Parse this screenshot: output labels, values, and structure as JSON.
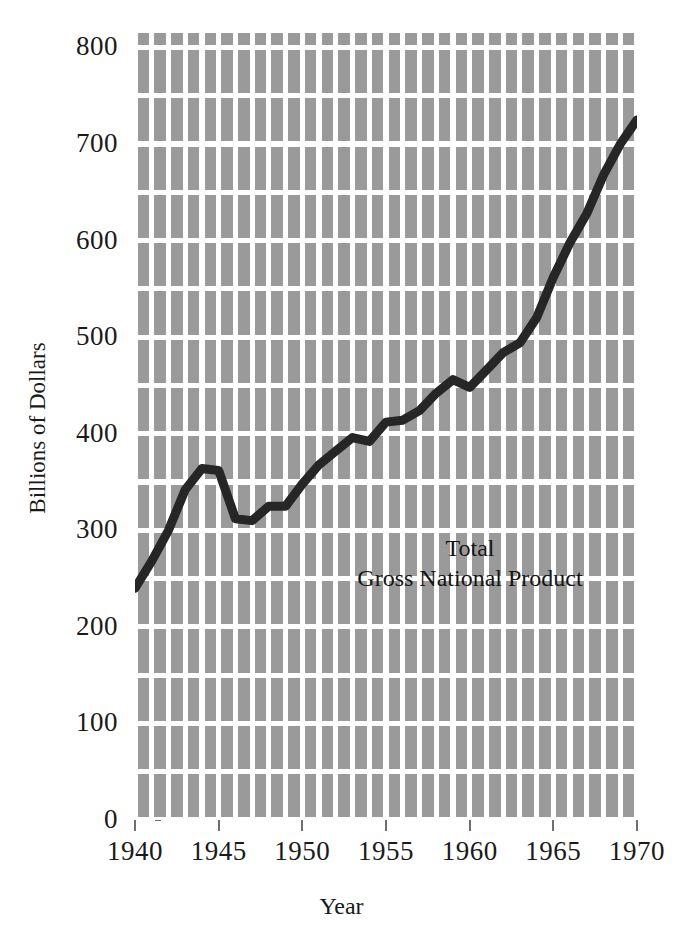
{
  "chart_data": {
    "type": "line",
    "title": "",
    "subtitle": "",
    "xlabel": "Year",
    "ylabel": "Billions of Dollars",
    "xlim": [
      1940,
      1970
    ],
    "ylim": [
      0,
      815
    ],
    "xticks": [
      1940,
      1945,
      1950,
      1955,
      1960,
      1965,
      1970
    ],
    "yticks": [
      0,
      100,
      200,
      300,
      400,
      500,
      600,
      700,
      800
    ],
    "xtick_labels": [
      "1940",
      "1945",
      "1950",
      "1955",
      "1960",
      "1965",
      "1970"
    ],
    "ytick_labels": [
      "0",
      "100",
      "200",
      "300",
      "400",
      "500",
      "600",
      "700",
      "800"
    ],
    "grid": true,
    "grid_minor_x_step": 1,
    "grid_major_y_step": 50,
    "legend": "none",
    "annotations": [
      {
        "name": "series-label",
        "line1": "Total",
        "line2": "Gross National Product",
        "x": 1953.5,
        "y": 330
      }
    ],
    "series": [
      {
        "name": "Total Gross National Product",
        "color": "#262626",
        "line_width": 9,
        "x": [
          1940,
          1941,
          1942,
          1943,
          1944,
          1945,
          1946,
          1947,
          1948,
          1949,
          1950,
          1951,
          1952,
          1953,
          1954,
          1955,
          1956,
          1957,
          1958,
          1959,
          1960,
          1961,
          1962,
          1963,
          1964,
          1965,
          1966,
          1967,
          1968,
          1969
        ],
        "values": [
          240,
          268,
          300,
          342,
          364,
          362,
          312,
          310,
          325,
          325,
          348,
          368,
          382,
          396,
          392,
          412,
          414,
          424,
          442,
          456,
          448,
          466,
          484,
          494,
          520,
          562,
          598,
          628,
          668,
          700
        ]
      }
    ],
    "endpoint_value": 725
  },
  "colors": {
    "plot_background": "#9a9a9a",
    "gridline": "#ffffff",
    "series_line": "#262626",
    "text": "#1a1a1a",
    "tick_mark": "#6f6f6f",
    "page_background": "#ffffff"
  }
}
